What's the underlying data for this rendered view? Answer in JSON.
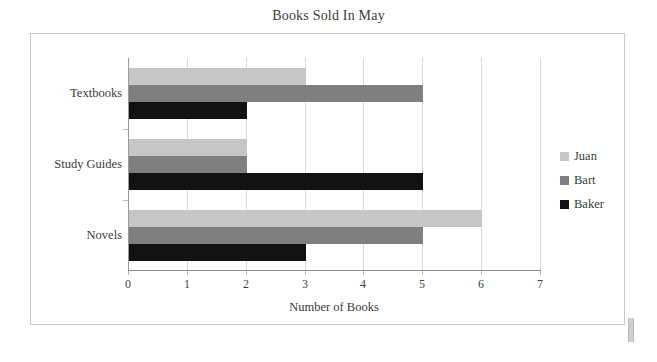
{
  "chart_data": {
    "type": "bar",
    "orientation": "horizontal",
    "title": "Books Sold In May",
    "xlabel": "Number of Books",
    "ylabel": "",
    "categories": [
      "Textbooks",
      "Study Guides",
      "Novels"
    ],
    "series": [
      {
        "name": "Juan",
        "color": "#c6c6c6",
        "values": [
          3,
          2,
          6
        ]
      },
      {
        "name": "Bart",
        "color": "#7f7f7f",
        "values": [
          5,
          2,
          5
        ]
      },
      {
        "name": "Baker",
        "color": "#121212",
        "values": [
          2,
          5,
          3
        ]
      }
    ],
    "xlim": [
      0,
      7
    ],
    "xticks": [
      0,
      1,
      2,
      3,
      4,
      5,
      6,
      7
    ],
    "xtick_labels": [
      "0",
      "1",
      "2",
      "3",
      "4",
      "5",
      "6",
      "7"
    ],
    "grid": true,
    "grid_axis": "x",
    "legend_position": "right",
    "legend_entries": [
      "Juan",
      "Bart",
      "Baker"
    ]
  },
  "colors": {
    "juan": "#c6c6c6",
    "bart": "#7f7f7f",
    "baker": "#121212",
    "gridline": "#d9d9d9",
    "frame": "#c9c9c9",
    "axis": "#8c8c8c",
    "text": "#3a3a3a"
  }
}
